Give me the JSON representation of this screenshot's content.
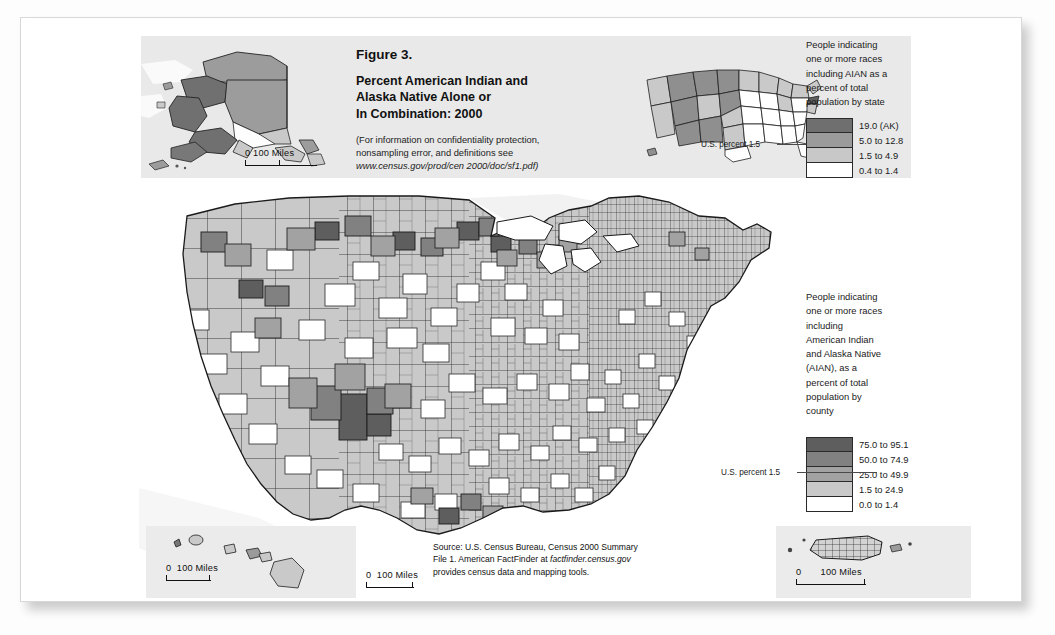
{
  "figure": {
    "number": "Figure 3.",
    "title_line1": "Percent American Indian and",
    "title_line2": "Alaska Native Alone or",
    "title_line3": "In Combination: 2000",
    "note_line1": "(For information on confidentiality protection,",
    "note_line2": "nonsampling error, and definitions see",
    "note_url": "www.census.gov/prod/cen 2000/doc/sf1.pdf)"
  },
  "state_legend": {
    "title_line1": "People indicating",
    "title_line2": "one or more races",
    "title_line3": "including AIAN as a",
    "title_line4": "percent of total",
    "title_line5": "population by state",
    "us_percent_label": "U.S. percent 1.5",
    "classes": [
      {
        "label": "19.0 (AK)",
        "color": "#6f6f6f"
      },
      {
        "label": "5.0 to 12.8",
        "color": "#9b9b9b"
      },
      {
        "label": "1.5 to 4.9",
        "color": "#c8c8c8"
      },
      {
        "label": "0.4 to 1.4",
        "color": "#ffffff"
      }
    ]
  },
  "county_legend": {
    "title_line1": "People indicating",
    "title_line2": "one or more races",
    "title_line3": "including",
    "title_line4": "American Indian",
    "title_line5": "and Alaska Native",
    "title_line6": "(AIAN), as a",
    "title_line7": "percent of total",
    "title_line8": "population by",
    "title_line9": "county",
    "us_percent_label": "U.S. percent 1.5",
    "classes": [
      {
        "label": "75.0 to 95.1",
        "color": "#5e5e5e"
      },
      {
        "label": "50.0 to 74.9",
        "color": "#818181"
      },
      {
        "label": "25.0 to 49.9",
        "color": "#a2a2a2"
      },
      {
        "label": "1.5 to 24.9",
        "color": "#c9c9c9"
      },
      {
        "label": "0.0 to 1.4",
        "color": "#ffffff"
      }
    ]
  },
  "scalebars": {
    "alaska": {
      "zero": "0",
      "distance": "100 Miles"
    },
    "hawaii": {
      "zero": "0",
      "distance": "100 Miles"
    },
    "mainland": {
      "zero": "0",
      "distance": "100 Miles"
    },
    "puerto_rico": {
      "zero": "0",
      "distance": "100 Miles"
    }
  },
  "source": {
    "line1": "Source: U.S. Census Bureau, Census 2000 Summary",
    "line2_pre": "File 1. American FactFinder at ",
    "line2_ital": "factfinder.census.gov",
    "line3": "provides census data and mapping tools."
  },
  "map_colors": {
    "land_base": "#c9c9c9",
    "water": "#ffffff",
    "border": "#1e1e1e",
    "band_bg": "#e9e9e9",
    "inset_bg": "#ebebeb"
  }
}
